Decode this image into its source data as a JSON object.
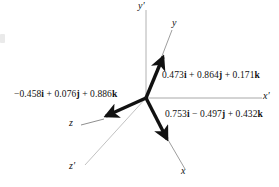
{
  "figure": {
    "background": "#ffffff",
    "width": 279,
    "height": 187,
    "origin": {
      "x": 146,
      "y": 98
    },
    "colors": {
      "vector": "#111111",
      "axis": "#aaaaaa",
      "text": "#111111"
    }
  },
  "axes": [
    {
      "key": "y-prime",
      "label": "y′",
      "kind": "primed",
      "from": {
        "x": 146,
        "y": 98
      },
      "to": {
        "x": 146,
        "y": 10
      },
      "label_pos": {
        "x": 139,
        "y": 2
      }
    },
    {
      "key": "x-prime",
      "label": "x′",
      "kind": "primed",
      "from": {
        "x": 146,
        "y": 98
      },
      "to": {
        "x": 262,
        "y": 98
      },
      "label_pos": {
        "x": 263,
        "y": 92
      }
    },
    {
      "key": "z-prime",
      "label": "z′",
      "kind": "primed",
      "from": {
        "x": 146,
        "y": 98
      },
      "to": {
        "x": 84,
        "y": 166
      },
      "label_pos": {
        "x": 72,
        "y": 164
      }
    },
    {
      "key": "y-axis",
      "label": "y",
      "kind": "rotated",
      "from": {
        "x": 146,
        "y": 98
      },
      "to": {
        "x": 172,
        "y": 29
      },
      "label_pos": {
        "x": 173,
        "y": 20
      }
    },
    {
      "key": "x-axis",
      "label": "x",
      "kind": "rotated",
      "from": {
        "x": 146,
        "y": 98
      },
      "to": {
        "x": 186,
        "y": 170
      },
      "label_pos": {
        "x": 182,
        "y": 170
      }
    },
    {
      "key": "z-axis",
      "label": "z",
      "kind": "rotated",
      "from": {
        "x": 146,
        "y": 98
      },
      "to": {
        "x": 80,
        "y": 126
      },
      "label_pos": {
        "x": 70,
        "y": 121
      }
    }
  ],
  "vectors": [
    {
      "key": "y-unit-vector",
      "axis": "y",
      "from": {
        "x": 146,
        "y": 98
      },
      "to": {
        "x": 163,
        "y": 56
      },
      "components": {
        "i": "0.473",
        "j": "0.864",
        "k": "0.171"
      },
      "label_text": "0.473i + 0.864j + 0.171k",
      "label_parts": [
        {
          "num": "0.473",
          "unit": "i",
          "sep": " + "
        },
        {
          "num": "0.864",
          "unit": "j",
          "sep": " + "
        },
        {
          "num": "0.171",
          "unit": "k",
          "sep": ""
        }
      ],
      "label_pos": {
        "x": 161,
        "y": 70
      }
    },
    {
      "key": "x-unit-vector",
      "axis": "x",
      "from": {
        "x": 146,
        "y": 98
      },
      "to": {
        "x": 168,
        "y": 141
      },
      "components": {
        "i": "0.753",
        "j": "−0.497",
        "k": "0.432"
      },
      "label_text": "0.753i − 0.497j + 0.432k",
      "label_parts": [
        {
          "num": "0.753",
          "unit": "i",
          "sep": " − "
        },
        {
          "num": "0.497",
          "unit": "j",
          "sep": " + "
        },
        {
          "num": "0.432",
          "unit": "k",
          "sep": ""
        }
      ],
      "label_pos": {
        "x": 165,
        "y": 110
      }
    },
    {
      "key": "z-unit-vector",
      "axis": "z",
      "from": {
        "x": 146,
        "y": 98
      },
      "to": {
        "x": 103,
        "y": 117
      },
      "components": {
        "i": "−0.458",
        "j": "0.076",
        "k": "0.886"
      },
      "label_text": "−0.458i + 0.076j + 0.886k",
      "label_parts": [
        {
          "num": "−0.458",
          "unit": "i",
          "sep": " + "
        },
        {
          "num": "0.076",
          "unit": "j",
          "sep": " + "
        },
        {
          "num": "0.886",
          "unit": "k",
          "sep": ""
        }
      ],
      "label_pos": {
        "x": 15,
        "y": 91
      }
    }
  ]
}
